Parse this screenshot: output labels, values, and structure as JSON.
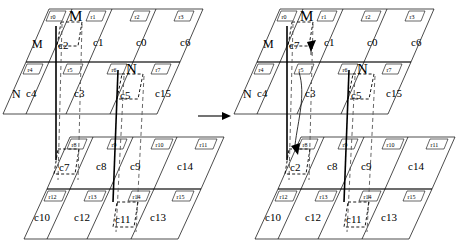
{
  "figure": {
    "transition_arrow": "→"
  },
  "diagrams": [
    {
      "id": "left",
      "name": "before-state",
      "rows": [
        {
          "tags": [
            "r0",
            "r1",
            "r2",
            "r3"
          ],
          "cells": [
            "c2",
            "c1",
            "c0",
            "c6"
          ]
        },
        {
          "tags": [
            "r4",
            "r5",
            "r6",
            "r7"
          ],
          "cells": [
            "c4",
            "c3",
            "c5",
            "c15"
          ]
        },
        {
          "tags": [
            "r8",
            "r9",
            "r10",
            "r11"
          ],
          "cells": [
            "c7",
            "c8",
            "c9",
            "c14"
          ]
        },
        {
          "tags": [
            "r12",
            "r13",
            "r14",
            "r15"
          ],
          "cells": [
            "c10",
            "c12",
            "c11",
            "c13"
          ]
        }
      ],
      "markers": [
        {
          "label": "M",
          "kind": "top-marker",
          "name": "marker-m-top"
        },
        {
          "label": "M",
          "kind": "side-marker",
          "name": "marker-m-side"
        },
        {
          "label": "N",
          "kind": "top-marker",
          "name": "marker-n-top"
        },
        {
          "label": "N",
          "kind": "side-marker",
          "name": "marker-n-side"
        }
      ],
      "highlighted": [
        "c2",
        "c5",
        "c7",
        "c11"
      ]
    },
    {
      "id": "right",
      "name": "after-state",
      "rows": [
        {
          "tags": [
            "r0",
            "r1",
            "r2",
            "r3"
          ],
          "cells": [
            "c7",
            "c1",
            "c0",
            "c6"
          ]
        },
        {
          "tags": [
            "r4",
            "r5",
            "r6",
            "r7"
          ],
          "cells": [
            "c4",
            "c3",
            "c5",
            "c15"
          ]
        },
        {
          "tags": [
            "r8",
            "r9",
            "r10",
            "r11"
          ],
          "cells": [
            "c2",
            "c8",
            "c9",
            "c14"
          ]
        },
        {
          "tags": [
            "r12",
            "r13",
            "r14",
            "r15"
          ],
          "cells": [
            "c10",
            "c12",
            "c11",
            "c13"
          ]
        }
      ],
      "markers": [
        {
          "label": "M",
          "kind": "top-marker",
          "name": "marker-m-top"
        },
        {
          "label": "M",
          "kind": "side-marker",
          "name": "marker-m-side"
        },
        {
          "label": "N",
          "kind": "top-marker",
          "name": "marker-n-top"
        },
        {
          "label": "N",
          "kind": "side-marker",
          "name": "marker-n-side"
        }
      ],
      "highlighted": [
        "c7",
        "c5",
        "c2",
        "c11"
      ]
    }
  ],
  "colors": {
    "stroke": "#000000",
    "background": "#ffffff",
    "guide": "#555555"
  }
}
